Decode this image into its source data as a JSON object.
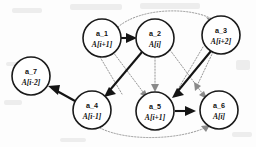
{
  "diagram": {
    "background_color": "#fdfdfd",
    "solid_edge_color": "#141414",
    "dotted_edge_color": "#8a8a8a",
    "node_stroke_color": "#1a1a1a",
    "node_fill_color": "#ffffff",
    "nodes": [
      {
        "key": "a1",
        "id": "a_1",
        "expr": "A[i+1]",
        "cx": 102,
        "cy": 38,
        "r": 19
      },
      {
        "key": "a2",
        "id": "a_2",
        "expr": "A[i]",
        "cx": 155,
        "cy": 38,
        "r": 19
      },
      {
        "key": "a3",
        "id": "a_3",
        "expr": "A[i+2]",
        "cx": 221,
        "cy": 35,
        "r": 19
      },
      {
        "key": "a7",
        "id": "a_7",
        "expr": "A[i-2]",
        "cx": 31,
        "cy": 76,
        "r": 19
      },
      {
        "key": "a4",
        "id": "a_4",
        "expr": "A[i-1]",
        "cx": 92,
        "cy": 110,
        "r": 19
      },
      {
        "key": "a5",
        "id": "a_5",
        "expr": "A[i+1]",
        "cx": 155,
        "cy": 111,
        "r": 19
      },
      {
        "key": "a6",
        "id": "a_6",
        "expr": "A[i]",
        "cx": 219,
        "cy": 110,
        "r": 19
      }
    ],
    "edges": [
      {
        "key": "e1",
        "from": "a_1",
        "to": "a_2",
        "style": "solid"
      },
      {
        "key": "e2",
        "from": "a_2",
        "to": "a_4",
        "style": "solid"
      },
      {
        "key": "e3",
        "from": "a_3",
        "to": "a_5",
        "style": "solid"
      },
      {
        "key": "e4",
        "from": "a_5",
        "to": "a_6",
        "style": "solid"
      },
      {
        "key": "e5",
        "from": "a_4",
        "to": "a_7",
        "style": "solid"
      },
      {
        "key": "e6",
        "from": "a_1",
        "to": "a_3",
        "style": "dotted"
      },
      {
        "key": "e7",
        "from": "a_4",
        "to": "a_6",
        "style": "dotted"
      },
      {
        "key": "e8",
        "from": "a_1",
        "to": "a_5",
        "style": "dotted"
      },
      {
        "key": "e9",
        "from": "a_2",
        "to": "a_5",
        "style": "dotted"
      },
      {
        "key": "e10",
        "from": "a_2",
        "to": "a_6",
        "style": "dotted"
      },
      {
        "key": "e11",
        "from": "a_3",
        "to": "a_6",
        "style": "dotted"
      }
    ]
  }
}
